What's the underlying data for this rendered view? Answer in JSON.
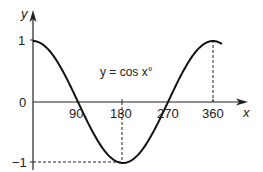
{
  "chart_data": {
    "type": "line",
    "title": "y = cos x°",
    "equation_label": "y = cos x°",
    "xlabel": "x",
    "ylabel": "y",
    "x_ticks": [
      90,
      180,
      270,
      360
    ],
    "x_tick_labels": [
      "90",
      "180",
      "270",
      "360"
    ],
    "y_ticks": [
      1,
      0,
      -1
    ],
    "y_tick_labels": [
      "1",
      "0",
      "−1"
    ],
    "xlim": [
      0,
      378
    ],
    "ylim": [
      -1,
      1
    ],
    "grid": false,
    "legend": "none",
    "guides": [
      {
        "type": "dashed-vertical",
        "x": 180,
        "from": 0,
        "to": -1
      },
      {
        "type": "dashed-horizontal",
        "y": -1,
        "from": 0,
        "to": 180
      },
      {
        "type": "dashed-vertical",
        "x": 360,
        "from": 1,
        "to": 0
      }
    ],
    "series": [
      {
        "name": "cos x",
        "x": [
          0,
          45,
          90,
          135,
          180,
          225,
          270,
          315,
          360,
          378
        ],
        "y": [
          1,
          0.707,
          0,
          -0.707,
          -1,
          -0.707,
          0,
          0.707,
          1,
          0.951
        ]
      }
    ]
  },
  "labels": {
    "y_axis": "y",
    "x_axis": "x",
    "equation": "y = cos x°",
    "tick_90": "90",
    "tick_180": "180",
    "tick_270": "270",
    "tick_360": "360",
    "tick_y1": "1",
    "tick_y0": "0",
    "tick_ym1": "−1"
  }
}
